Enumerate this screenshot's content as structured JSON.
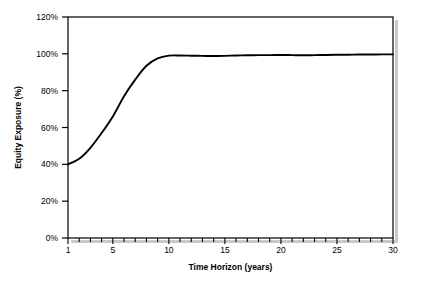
{
  "chart_data": {
    "type": "line",
    "title": "",
    "xlabel": "Time Horizon (years)",
    "ylabel": "Equity Exposure (%)",
    "xlim": [
      1,
      30
    ],
    "ylim": [
      0,
      120
    ],
    "grid": false,
    "legend": null,
    "x_tick_labels": [
      "1",
      "5",
      "10",
      "15",
      "20",
      "25",
      "30"
    ],
    "x_tick_values": [
      1,
      5,
      10,
      15,
      20,
      25,
      30
    ],
    "x_minor_tick_values": [
      1,
      2,
      3,
      4,
      5,
      6,
      7,
      8,
      9,
      10,
      11,
      12,
      13,
      14,
      15,
      16,
      17,
      18,
      19,
      20,
      21,
      22,
      23,
      24,
      25,
      26,
      27,
      28,
      29,
      30
    ],
    "y_tick_labels": [
      "0%",
      "20%",
      "40%",
      "60%",
      "80%",
      "100%",
      "120%"
    ],
    "y_tick_values": [
      0,
      20,
      40,
      60,
      80,
      100,
      120
    ],
    "series": [
      {
        "name": "Equity Exposure",
        "color": "#000000",
        "x": [
          1,
          2,
          3,
          4,
          5,
          6,
          7,
          8,
          9,
          10,
          11,
          12,
          13,
          14,
          15,
          16,
          17,
          18,
          19,
          20,
          21,
          22,
          23,
          24,
          25,
          26,
          27,
          28,
          29,
          30
        ],
        "values": [
          40.0,
          43.0,
          49.0,
          57.0,
          66.0,
          77.0,
          86.0,
          93.5,
          97.5,
          99.0,
          99.1,
          99.0,
          98.9,
          98.8,
          98.9,
          99.1,
          99.2,
          99.3,
          99.3,
          99.4,
          99.3,
          99.2,
          99.3,
          99.4,
          99.5,
          99.5,
          99.6,
          99.6,
          99.7,
          99.7
        ]
      }
    ]
  },
  "axes": {
    "x_title": "Time Horizon (years)",
    "y_title": "Equity Exposure (%)"
  },
  "colors": {
    "line": "#000000",
    "frame": "#000000",
    "background": "#ffffff",
    "shadow": "#b0b0b0"
  }
}
